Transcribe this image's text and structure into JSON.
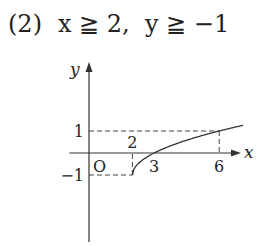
{
  "heading": {
    "number": "(2)",
    "cond1": "x ≧ 2,",
    "cond2": "y ≧ −1"
  },
  "chart_data": {
    "type": "line",
    "title": "",
    "xlabel": "x",
    "ylabel": "y",
    "origin_label": "O",
    "xlim": [
      -1,
      8
    ],
    "ylim": [
      -4.1,
      4
    ],
    "grid": false,
    "series": [
      {
        "name": "y = √(x−2) − 1",
        "x": [
          2,
          2.25,
          3,
          4,
          5,
          6,
          7
        ],
        "y": [
          -1,
          -0.5,
          0,
          0.414,
          0.732,
          1,
          1.236
        ]
      }
    ],
    "x_ticks": [
      {
        "value": 2,
        "label": "2",
        "position": "above"
      },
      {
        "value": 3,
        "label": "3",
        "position": "below"
      },
      {
        "value": 6,
        "label": "6",
        "position": "below"
      }
    ],
    "y_ticks": [
      {
        "value": 1,
        "label": "1"
      },
      {
        "value": -1,
        "label": "−1"
      }
    ],
    "guides": [
      {
        "from": [
          0,
          1
        ],
        "to": [
          6,
          1
        ]
      },
      {
        "from": [
          6,
          1
        ],
        "to": [
          6,
          0
        ]
      },
      {
        "from": [
          0,
          -1
        ],
        "to": [
          2,
          -1
        ]
      },
      {
        "from": [
          2,
          -1
        ],
        "to": [
          2,
          0
        ]
      }
    ]
  }
}
